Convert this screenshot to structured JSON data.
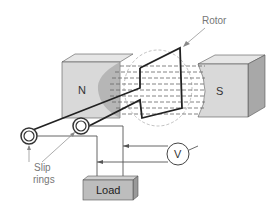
{
  "diagram": {
    "labels": {
      "rotor": "Rotor",
      "north": "N",
      "south": "S",
      "slip_rings_line1": "Slip",
      "slip_rings_line2": "rings",
      "load": "Load",
      "voltmeter": "V"
    },
    "colors": {
      "magnet_face": "#d9d9d9",
      "magnet_side": "#a8a8a8",
      "magnet_top": "#e6e6e6",
      "field_lines": "#666666",
      "conductor": "#222222",
      "label": "#777777",
      "load_box": "#bdbdbd"
    }
  }
}
